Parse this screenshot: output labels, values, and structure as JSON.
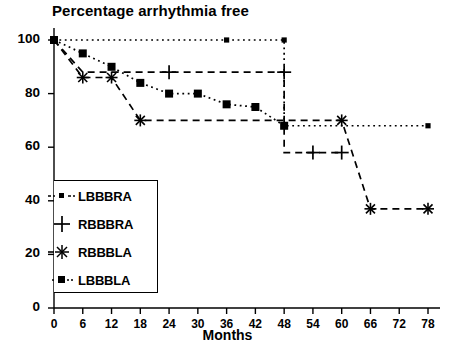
{
  "chart_data": {
    "type": "line",
    "title": "Percentage arrhythmia free",
    "xlabel": "Months",
    "ylabel": "",
    "xlim": [
      0,
      80
    ],
    "ylim": [
      0,
      104
    ],
    "xticks": [
      0,
      6,
      12,
      18,
      24,
      30,
      36,
      42,
      48,
      54,
      60,
      66,
      72,
      78
    ],
    "yticks": [
      0,
      20,
      40,
      60,
      80,
      100
    ],
    "xtick_labels": [
      "0",
      "6",
      "12",
      "18",
      "24",
      "30",
      "36",
      "42",
      "48",
      "54",
      "60",
      "66",
      "72",
      "78"
    ],
    "ytick_labels": [
      "0",
      "20",
      "40",
      "60",
      "80",
      "100"
    ],
    "grid": false,
    "legend_position": "lower-left",
    "step_style": "kaplan-meier",
    "series": [
      {
        "name": "LBBBRA",
        "line_style": "dotted",
        "marker": "small-square",
        "x": [
          0,
          36,
          48,
          48,
          78
        ],
        "y": [
          100,
          100,
          100,
          68,
          68
        ],
        "marker_points": [
          {
            "x": 0,
            "y": 100
          },
          {
            "x": 36,
            "y": 100
          },
          {
            "x": 48,
            "y": 100
          },
          {
            "x": 78,
            "y": 68
          }
        ]
      },
      {
        "name": "RBBBRA",
        "line_style": "dashed",
        "marker": "plus",
        "x": [
          0,
          6,
          24,
          48,
          48,
          54,
          60
        ],
        "y": [
          100,
          88,
          88,
          88,
          58,
          58,
          58
        ],
        "marker_points": [
          {
            "x": 24,
            "y": 88
          },
          {
            "x": 48,
            "y": 88
          },
          {
            "x": 54,
            "y": 58
          },
          {
            "x": 60,
            "y": 58
          }
        ]
      },
      {
        "name": "RBBBLA",
        "line_style": "dashed",
        "marker": "asterisk",
        "x": [
          0,
          6,
          12,
          18,
          48,
          60,
          66,
          78
        ],
        "y": [
          100,
          86,
          86,
          70,
          70,
          70,
          37,
          37
        ],
        "marker_points": [
          {
            "x": 6,
            "y": 86
          },
          {
            "x": 12,
            "y": 86
          },
          {
            "x": 18,
            "y": 70
          },
          {
            "x": 60,
            "y": 70
          },
          {
            "x": 66,
            "y": 37
          },
          {
            "x": 78,
            "y": 37
          }
        ]
      },
      {
        "name": "LBBBLA",
        "line_style": "dotted",
        "marker": "square",
        "x": [
          0,
          6,
          12,
          18,
          24,
          30,
          36,
          42,
          48
        ],
        "y": [
          100,
          95,
          90,
          84,
          80,
          80,
          76,
          75,
          68
        ],
        "marker_points": [
          {
            "x": 0,
            "y": 100
          },
          {
            "x": 6,
            "y": 95
          },
          {
            "x": 12,
            "y": 90
          },
          {
            "x": 18,
            "y": 84
          },
          {
            "x": 24,
            "y": 80
          },
          {
            "x": 30,
            "y": 80
          },
          {
            "x": 36,
            "y": 76
          },
          {
            "x": 42,
            "y": 75
          },
          {
            "x": 48,
            "y": 68
          }
        ]
      }
    ],
    "legend": [
      {
        "label": "LBBBRA",
        "marker": "small-square",
        "line_style": "dotted"
      },
      {
        "label": "RBBBRA",
        "marker": "plus",
        "line_style": "none"
      },
      {
        "label": "RBBBLA",
        "marker": "asterisk",
        "line_style": "none"
      },
      {
        "label": "LBBBLA",
        "marker": "square",
        "line_style": "dotted"
      }
    ],
    "colors": {
      "axis": "#000000",
      "series": "#000000",
      "background": "#ffffff"
    }
  }
}
